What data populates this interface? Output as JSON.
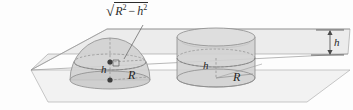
{
  "figure": {
    "name": "cavalieri-hemisphere-cylinder-diagram",
    "labels": {
      "cross_section_radius": "√R² − h²",
      "cross_section_radius_parts": {
        "radical": "√",
        "first_base": "R",
        "first_exponent": "2",
        "operator": "−",
        "second_base": "h",
        "second_exponent": "2"
      },
      "hemisphere_height": "h",
      "hemisphere_radius": "R",
      "cylinder_height": "h",
      "cylinder_radius": "R",
      "plane_gap_height": "h"
    },
    "colors": {
      "ink": "#4a4a4a",
      "text": "#2b2b2b",
      "plane_fill": "#e9e9e9",
      "plane_fill_lower": "#f2f2f2",
      "plane_stroke": "#9a9a9a",
      "solid_fill": "#cfcfcf",
      "solid_fill_light": "#dedede",
      "solid_stroke": "#8c8c8c",
      "dashed_stroke": "#8c8c8c",
      "dot_fill": "#3d3d3d",
      "leader_stroke": "#6e6e6e",
      "background": "#fdfdfd"
    },
    "elements": {
      "upper_plane": "upper cutting plane",
      "lower_plane": "lower base plane",
      "hemisphere": "hemisphere of radius R",
      "cylinder": "cylinder of radius R",
      "leader_line": "leader from formula to cross-section radius",
      "right_angle_mark": "right angle mark at hemisphere center",
      "center_dot_upper": "cross-section center point",
      "center_dot_lower": "hemisphere base center point",
      "dimension_arrow": "vertical h dimension arrow at right"
    }
  }
}
